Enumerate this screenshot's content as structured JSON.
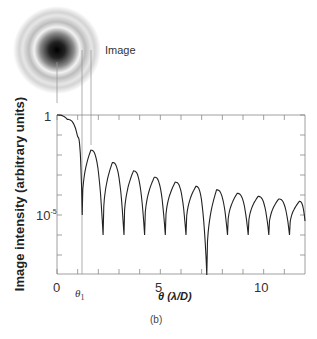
{
  "chart_data": {
    "type": "line",
    "title": "",
    "subtitle": "",
    "caption": "(b)",
    "xlabel": "θ (λ/D)",
    "ylabel": "Image intensity (arbitrary units)",
    "xscale": "linear",
    "yscale": "log",
    "xlim": [
      0,
      12
    ],
    "ylim": [
      1e-08,
      1
    ],
    "x_ticks": [
      0,
      5,
      10
    ],
    "x_tick_labels": [
      "0",
      "5",
      "10"
    ],
    "x_minor_ticks": [
      1,
      2,
      3,
      4,
      6,
      7,
      8,
      9,
      11
    ],
    "y_tick_labels": [
      "1",
      "10⁻⁵"
    ],
    "y_ticks": [
      1,
      1e-05
    ],
    "annotations": [
      {
        "text": "θ₁",
        "x": 1.22,
        "note": "first dark ring; vertical line from image to curve"
      },
      {
        "text": "Image",
        "note": "Airy disk pattern shown above plot"
      }
    ],
    "grid": false,
    "legend": null,
    "series": [
      {
        "name": "Airy pattern intensity",
        "description": "Normalized Airy disk intensity [2J1(πθ)/(πθ)]² vs θ in λ/D, log scale, with nulls at ~1.22, 2.23, 3.24, 4.24, 5.24, 6.24, 7.25, 8.25, 9.25, 10.25, 11.25",
        "x": [
          0,
          0.5,
          1.0,
          1.22,
          1.64,
          2.23,
          2.68,
          3.24,
          3.7,
          4.24,
          4.71,
          5.24,
          5.72,
          6.24,
          6.72,
          7.25,
          7.72,
          8.25,
          8.72,
          9.25,
          9.73,
          10.25,
          10.73,
          11.25,
          11.73,
          12.0
        ],
        "y": [
          1,
          0.6,
          0.08,
          1e-05,
          0.0175,
          1e-06,
          0.0042,
          1e-06,
          0.0016,
          1e-06,
          0.00078,
          1e-06,
          0.00044,
          1e-06,
          0.00027,
          1e-08,
          0.00018,
          1e-06,
          0.00012,
          1e-06,
          8.5e-05,
          1e-06,
          6.3e-05,
          1e-06,
          4.8e-05,
          5e-06
        ]
      }
    ]
  },
  "labels": {
    "image": "Image",
    "theta1": "θ",
    "theta1_sub": "1",
    "y_one": "1",
    "y_e5_base": "10",
    "y_e5_exp": "-5",
    "x0": "0",
    "x5": "5",
    "x10": "10",
    "xlabel_theta": "θ",
    "xlabel_unit": " (λ/D)",
    "ylabel": "Image intensity (arbitrary units)",
    "caption": "(b)"
  },
  "colors": {
    "curve": "#222222",
    "axis": "#888888",
    "guide": "#999999"
  }
}
